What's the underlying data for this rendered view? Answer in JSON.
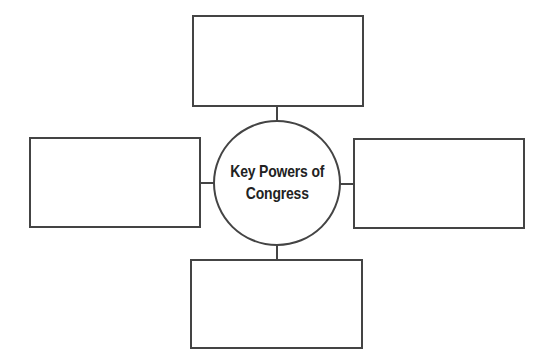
{
  "diagram": {
    "type": "concept-web",
    "center": {
      "label_line1": "Key Powers of",
      "label_line2": "Congress"
    },
    "boxes": [
      {
        "position": "top",
        "text": ""
      },
      {
        "position": "left",
        "text": ""
      },
      {
        "position": "right",
        "text": ""
      },
      {
        "position": "bottom",
        "text": ""
      }
    ],
    "colors": {
      "stroke": "#444444",
      "background": "#ffffff",
      "text": "#222222"
    }
  }
}
